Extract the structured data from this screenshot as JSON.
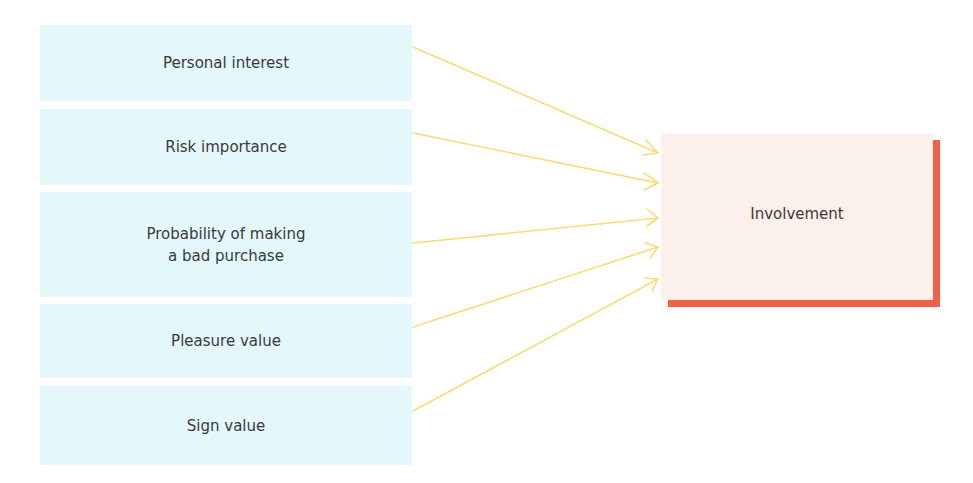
{
  "diagram": {
    "sources": [
      {
        "label": "Personal interest",
        "top": 25,
        "height": 76
      },
      {
        "label": "Risk importance",
        "top": 109,
        "height": 76
      },
      {
        "label": "Probability of making\na bad purchase",
        "top": 192,
        "height": 105
      },
      {
        "label": "Pleasure value",
        "top": 304,
        "height": 74
      },
      {
        "label": "Sign value",
        "top": 386,
        "height": 79
      }
    ],
    "target": {
      "label": "Involvement"
    },
    "arrows": [
      {
        "from": "Personal interest",
        "to": "Involvement"
      },
      {
        "from": "Risk importance",
        "to": "Involvement"
      },
      {
        "from": "Probability of making a bad purchase",
        "to": "Involvement"
      },
      {
        "from": "Pleasure value",
        "to": "Involvement"
      },
      {
        "from": "Sign value",
        "to": "Involvement"
      }
    ],
    "colors": {
      "source_fill": "#e4f7fb",
      "target_fill": "#fcf0ea",
      "target_shadow": "#f0604a",
      "arrow": "#f7dc78",
      "text": "#3a3a3a"
    }
  }
}
